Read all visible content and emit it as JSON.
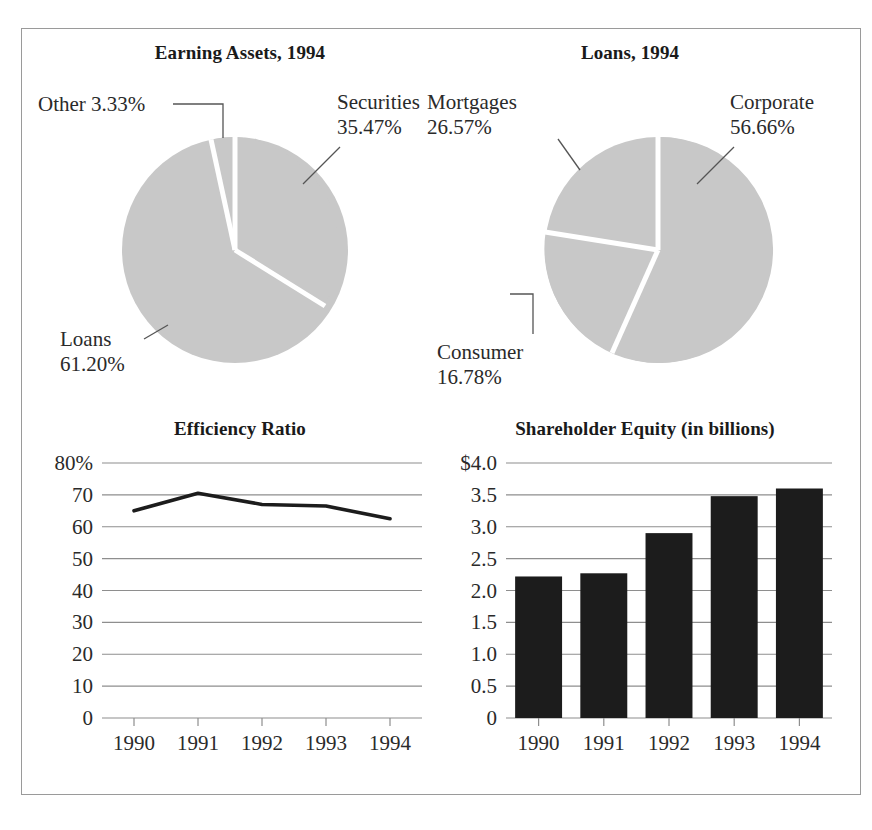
{
  "figure": {
    "background": "#ffffff",
    "border_color": "#9a9a9a",
    "pie_fill": "#c8c8c8",
    "bar_fill": "#1c1c1c",
    "line_color": "#1c1c1c",
    "grid_color": "#8e8e8e"
  },
  "panels": {
    "earning_assets": {
      "title": "Earning Assets, 1994"
    },
    "loans": {
      "title": "Loans, 1994"
    },
    "efficiency": {
      "title": "Efficiency Ratio"
    },
    "equity": {
      "title": "Shareholder Equity (in billions)"
    }
  },
  "labels": {
    "other": "Other 3.33%",
    "securities_l1": "Securities",
    "securities_l2": "35.47%",
    "loans_l1": "Loans",
    "loans_l2": "61.20%",
    "mortgages_l1": "Mortgages",
    "mortgages_l2": "26.57%",
    "corporate_l1": "Corporate",
    "corporate_l2": "56.66%",
    "consumer_l1": "Consumer",
    "consumer_l2": "16.78%"
  },
  "chart_data": [
    {
      "type": "pie",
      "title": "Earning Assets, 1994",
      "labels": [
        "Loans",
        "Securities",
        "Other"
      ],
      "values": [
        61.2,
        35.47,
        3.33
      ],
      "value_labels": [
        "61.20%",
        "35.47%",
        "3.33%"
      ],
      "annotations": [
        "Other 3.33%",
        "Securities 35.47%",
        "Loans 61.20%"
      ],
      "legend": "callout-labels",
      "colors": [
        "#c8c8c8",
        "#c8c8c8",
        "#c8c8c8"
      ]
    },
    {
      "type": "pie",
      "title": "Loans, 1994",
      "labels": [
        "Corporate",
        "Consumer",
        "Mortgages"
      ],
      "values": [
        56.66,
        16.78,
        26.57
      ],
      "value_labels": [
        "56.66%",
        "16.78%",
        "26.57%"
      ],
      "annotations": [
        "Mortgages 26.57%",
        "Corporate 56.66%",
        "Consumer 16.78%"
      ],
      "legend": "callout-labels",
      "colors": [
        "#c8c8c8",
        "#c8c8c8",
        "#c8c8c8"
      ]
    },
    {
      "type": "line",
      "title": "Efficiency Ratio",
      "xlabel": "",
      "ylabel": "",
      "categories": [
        "1990",
        "1991",
        "1992",
        "1993",
        "1994"
      ],
      "values": [
        65.0,
        70.5,
        67.0,
        66.5,
        62.5
      ],
      "yticks": [
        0,
        10,
        20,
        30,
        40,
        50,
        60,
        70,
        80
      ],
      "ytick_labels": [
        "0",
        "10",
        "20",
        "30",
        "40",
        "50",
        "60",
        "70",
        "80%"
      ],
      "ylim": [
        0,
        80
      ],
      "grid": true,
      "legend": "none"
    },
    {
      "type": "bar",
      "title": "Shareholder Equity (in billions)",
      "xlabel": "",
      "ylabel": "",
      "categories": [
        "1990",
        "1991",
        "1992",
        "1993",
        "1994"
      ],
      "values": [
        2.22,
        2.27,
        2.9,
        3.48,
        3.6
      ],
      "yticks": [
        0,
        0.5,
        1.0,
        1.5,
        2.0,
        2.5,
        3.0,
        3.5,
        4.0
      ],
      "ytick_labels": [
        "0",
        "0.5",
        "1.0",
        "1.5",
        "2.0",
        "2.5",
        "3.0",
        "3.5",
        "$4.0"
      ],
      "ylim": [
        0,
        4.0
      ],
      "grid": true,
      "legend": "none"
    }
  ]
}
